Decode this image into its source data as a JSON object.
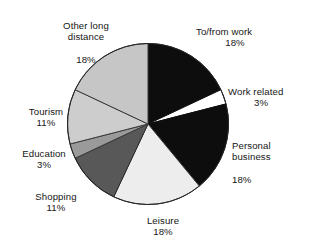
{
  "chart_data": {
    "type": "pie",
    "title": "",
    "subtitle": "",
    "xlabel": "",
    "ylabel": "",
    "legend_position": "none",
    "grid": false,
    "label_format": "name + percent",
    "start_angle_deg": 0,
    "direction": "clockwise",
    "categories": [
      "To/from work",
      "Work related",
      "Personal business",
      "Leisure",
      "Shopping",
      "Education",
      "Tourism",
      "Other long distance"
    ],
    "values": [
      18,
      3,
      18,
      18,
      11,
      3,
      11,
      18
    ],
    "unit": "%",
    "slices": [
      {
        "name": "To/from work",
        "label_line1": "To/from work",
        "percent_text": "18%",
        "value": 18,
        "color": "#0d0d0d",
        "stroke": "#0d0d0d",
        "start_deg": 0,
        "end_deg": 64.8
      },
      {
        "name": "Work related",
        "label_line1": "Work related",
        "percent_text": "3%",
        "value": 3,
        "color": "#ffffff",
        "stroke": "#0d0d0d",
        "start_deg": 64.8,
        "end_deg": 75.6
      },
      {
        "name": "Personal business",
        "label_line1": "Personal",
        "label_line2": "business",
        "percent_text": "18%",
        "value": 18,
        "color": "#0d0d0d",
        "stroke": "#0d0d0d",
        "start_deg": 75.6,
        "end_deg": 140.4
      },
      {
        "name": "Leisure",
        "label_line1": "Leisure",
        "percent_text": "18%",
        "value": 18,
        "color": "#ededed",
        "stroke": "#3a3a3a",
        "start_deg": 140.4,
        "end_deg": 205.2
      },
      {
        "name": "Shopping",
        "label_line1": "Shopping",
        "percent_text": "11%",
        "value": 11,
        "color": "#585858",
        "stroke": "#2a2a2a",
        "start_deg": 205.2,
        "end_deg": 244.8
      },
      {
        "name": "Education",
        "label_line1": "Education",
        "percent_text": "3%",
        "value": 3,
        "color": "#9a9a9a",
        "stroke": "#3a3a3a",
        "start_deg": 244.8,
        "end_deg": 255.6
      },
      {
        "name": "Tourism",
        "label_line1": "Tourism",
        "percent_text": "11%",
        "value": 11,
        "color": "#cdcdcd",
        "stroke": "#3a3a3a",
        "start_deg": 255.6,
        "end_deg": 295.2
      },
      {
        "name": "Other long distance",
        "label_line1": "Other long",
        "label_line2": "distance",
        "percent_text": "18%",
        "value": 18,
        "color": "#c6c6c6",
        "stroke": "#3a3a3a",
        "start_deg": 295.2,
        "end_deg": 360
      }
    ]
  },
  "labels": {
    "other_long_distance": {
      "line1": "Other long",
      "line2": "distance",
      "pct": "18%"
    },
    "tofrom_work": {
      "line1": "To/from work",
      "pct": "18%"
    },
    "work_related": {
      "line1": "Work related",
      "pct": "3%"
    },
    "personal_business": {
      "line1": "Personal",
      "line2": "business",
      "pct": "18%"
    },
    "leisure": {
      "line1": "Leisure",
      "pct": "18%"
    },
    "shopping": {
      "line1": "Shopping",
      "pct": "11%"
    },
    "education": {
      "line1": "Education",
      "pct": "3%"
    },
    "tourism": {
      "line1": "Tourism",
      "pct": "11%"
    }
  }
}
